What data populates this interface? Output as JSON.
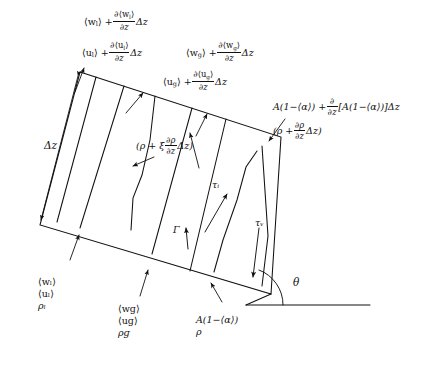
{
  "figure": {
    "background": "#ffffff",
    "stroke": "#111111",
    "width": 446,
    "height": 367
  },
  "labels": {
    "top_wl": {
      "text": "⟨wₗ⟩ + ∂⟨wₗ⟩/∂z Δz",
      "lead": "⟨w",
      "sub1": "l",
      "mid": "⟩ +",
      "num": "∂⟨w",
      "num_sub": "l",
      "num_end": "⟩",
      "den": "∂z",
      "tail": "Δz"
    },
    "top_ul": {
      "lead": "⟨u",
      "sub1": "l",
      "mid": "⟩ +",
      "num": "∂⟨u",
      "num_sub": "l",
      "num_end": "⟩",
      "den": "∂z",
      "tail": "Δz"
    },
    "top_wg": {
      "lead": "⟨w",
      "sub1": "g",
      "mid": "⟩ +",
      "num": "∂⟨w",
      "num_sub": "g",
      "num_end": "⟩",
      "den": "∂z",
      "tail": "Δz"
    },
    "top_ug": {
      "lead": "⟨u",
      "sub1": "g",
      "mid": "⟩ +",
      "num": "∂⟨u",
      "num_sub": "g",
      "num_end": "⟩",
      "den": "∂z",
      "tail": "Δz"
    },
    "area_top": {
      "lead": "A(1−⟨α⟩) +",
      "num": "∂",
      "den": "∂z",
      "tail": "[A(1−⟨α⟩)]Δz"
    },
    "rho_top": {
      "lead": "(ρ +",
      "num": "∂ρ",
      "den": "∂z",
      "tail": "Δz)"
    },
    "rho_xi": {
      "lead": "(ρ + ξ",
      "num": "∂ρ",
      "den": "∂z",
      "tail": "Δz)"
    },
    "delta_z": "Δz",
    "liquid_stack": {
      "w": "⟨wₗ⟩",
      "u": "⟨uₗ⟩",
      "rho": "ρₗ"
    },
    "gas_stack": {
      "w": "⟨wɡ⟩",
      "u": "⟨uɡ⟩",
      "rho": "ρɡ"
    },
    "area_bottom": {
      "area": "A(1−⟨α⟩)",
      "rho": "ρ"
    },
    "tau_i": "τᵢ",
    "tau_w": "τᵥ",
    "gamma": "Γ",
    "theta": "θ"
  }
}
